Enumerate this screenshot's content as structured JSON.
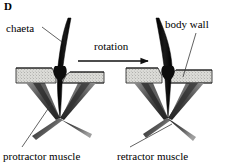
{
  "figure": {
    "panel_letter": "D",
    "caption_labels": {
      "chaeta": "chaeta",
      "body_wall": "body wall",
      "rotation": "rotation",
      "protractor_muscle": "protractor muscle",
      "retractor_muscle": "retractor muscle"
    },
    "icons": {
      "arrow": "rotation-arrow-icon",
      "leader_line": "leader-line-icon"
    },
    "colors": {
      "ink": "#000000",
      "background": "#ffffff",
      "body_wall_fill": "#d8d8d4",
      "body_wall_stipple": "#6b6b68",
      "muscle_dark": "#262626",
      "muscle_mid": "#5a5a5a",
      "muscle_light": "#9a9a9a",
      "chaeta": "#111111",
      "leader": "#3a3a3a"
    },
    "diagrams": [
      {
        "id": "left-diagram",
        "name": "chaeta-protracted-diagram",
        "state": "protracted",
        "chaeta_tilt": "curving-right"
      },
      {
        "id": "right-diagram",
        "name": "chaeta-retracted-diagram",
        "state": "retracted",
        "chaeta_tilt": "curving-left"
      }
    ]
  }
}
